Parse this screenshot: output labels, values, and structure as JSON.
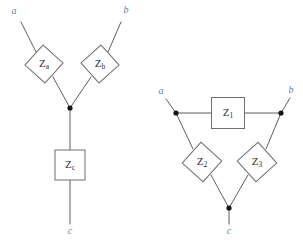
{
  "figure": {
    "background_color": "#ffffff",
    "wire_color": "#5a5f66",
    "outline_color": "#6b7075",
    "node_color": "#111418",
    "terminal_label_color": "#5b86b5",
    "component_label_color": "#2b2f33",
    "width": 303,
    "height": 243
  },
  "networks": [
    {
      "id": "wye-network",
      "name": "Y network",
      "terminals": [
        {
          "name": "terminal-a",
          "label": "a",
          "x": 14,
          "y": 12
        },
        {
          "name": "terminal-b",
          "label": "b",
          "x": 126,
          "y": 11
        },
        {
          "name": "terminal-c",
          "label": "c",
          "x": 70,
          "y": 232
        }
      ],
      "nodes": [
        {
          "name": "center-node",
          "x": 70,
          "y": 108,
          "r": 2.6
        }
      ],
      "components": [
        {
          "name": "impedance-za",
          "shape": "diamond",
          "label": "Z",
          "subscript": "a",
          "cx": 44,
          "cy": 64,
          "size": 27,
          "rotation": 42
        },
        {
          "name": "impedance-zb",
          "shape": "diamond",
          "label": "Z",
          "subscript": "b",
          "cx": 100,
          "cy": 64,
          "size": 27,
          "rotation": 48
        },
        {
          "name": "impedance-zc",
          "shape": "rectangle",
          "label": "Z",
          "subscript": "c",
          "cx": 70,
          "cy": 165,
          "width": 30,
          "height": 30,
          "rotation": 0
        }
      ],
      "wires": [
        {
          "name": "wire-a-to-za",
          "x1": 21,
          "y1": 22,
          "x2": 36,
          "y2": 52
        },
        {
          "name": "wire-za-to-node",
          "x1": 53,
          "y1": 77,
          "x2": 70,
          "y2": 108
        },
        {
          "name": "wire-b-to-zb",
          "x1": 121,
          "y1": 22,
          "x2": 108,
          "y2": 52
        },
        {
          "name": "wire-zb-to-node",
          "x1": 91,
          "y1": 77,
          "x2": 70,
          "y2": 108
        },
        {
          "name": "wire-node-to-zc",
          "x1": 70,
          "y1": 108,
          "x2": 70,
          "y2": 150
        },
        {
          "name": "wire-zc-to-c",
          "x1": 70,
          "y1": 180,
          "x2": 70,
          "y2": 224
        }
      ]
    },
    {
      "id": "delta-network",
      "name": "Delta network",
      "terminals": [
        {
          "name": "terminal-a",
          "label": "a",
          "x": 161,
          "y": 92
        },
        {
          "name": "terminal-b",
          "label": "b",
          "x": 291,
          "y": 91
        },
        {
          "name": "terminal-c",
          "label": "c",
          "x": 229,
          "y": 232
        }
      ],
      "nodes": [
        {
          "name": "node-a",
          "x": 176,
          "y": 113,
          "r": 2.6
        },
        {
          "name": "node-b",
          "x": 281,
          "y": 113,
          "r": 2.6
        },
        {
          "name": "node-c",
          "x": 229,
          "y": 208,
          "r": 2.6
        }
      ],
      "components": [
        {
          "name": "impedance-z1",
          "shape": "rectangle",
          "label": "Z",
          "subscript": "1",
          "cx": 228,
          "cy": 113,
          "width": 33,
          "height": 31,
          "rotation": 0
        },
        {
          "name": "impedance-z2",
          "shape": "diamond",
          "label": "Z",
          "subscript": "2",
          "cx": 202,
          "cy": 162,
          "size": 28,
          "rotation": 42
        },
        {
          "name": "impedance-z3",
          "shape": "diamond",
          "label": "Z",
          "subscript": "3",
          "cx": 257,
          "cy": 162,
          "size": 28,
          "rotation": 48
        }
      ],
      "wires": [
        {
          "name": "wire-a-lead",
          "x1": 166,
          "y1": 99,
          "x2": 176,
          "y2": 113
        },
        {
          "name": "wire-b-lead",
          "x1": 290,
          "y1": 98,
          "x2": 281,
          "y2": 113
        },
        {
          "name": "wire-nodea-to-z1",
          "x1": 176,
          "y1": 113,
          "x2": 212,
          "y2": 113
        },
        {
          "name": "wire-z1-to-nodeb",
          "x1": 245,
          "y1": 113,
          "x2": 281,
          "y2": 113
        },
        {
          "name": "wire-nodea-to-z2",
          "x1": 176,
          "y1": 113,
          "x2": 193,
          "y2": 149
        },
        {
          "name": "wire-z2-to-nodec",
          "x1": 211,
          "y1": 175,
          "x2": 229,
          "y2": 208
        },
        {
          "name": "wire-nodeb-to-z3",
          "x1": 281,
          "y1": 113,
          "x2": 266,
          "y2": 149
        },
        {
          "name": "wire-z3-to-nodec",
          "x1": 248,
          "y1": 175,
          "x2": 229,
          "y2": 208
        },
        {
          "name": "wire-nodec-to-c",
          "x1": 229,
          "y1": 208,
          "x2": 229,
          "y2": 224
        }
      ]
    }
  ]
}
